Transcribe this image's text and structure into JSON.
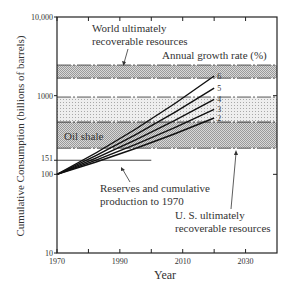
{
  "chart_data": {
    "type": "line",
    "title": "",
    "xlabel": "Year",
    "ylabel": "Cumulative Consumption (billions of barrels)",
    "yscale": "log",
    "xlim": [
      1970,
      2040
    ],
    "ylim": [
      10,
      10000
    ],
    "x_ticks": [
      1970,
      1990,
      2010,
      2030
    ],
    "x_minor_ticks": [
      1980,
      2000,
      2020
    ],
    "y_ticks": [
      {
        "value": 10,
        "label": "10"
      },
      {
        "value": 100,
        "label": "100"
      },
      {
        "value": 151,
        "label": "151"
      },
      {
        "value": 1000,
        "label": "1000"
      },
      {
        "value": 10000,
        "label": "10,000"
      }
    ],
    "legend_title": "Annual growth rate (%)",
    "series": [
      {
        "name": "2",
        "x": [
          1970,
          2020
        ],
        "y": [
          100,
          520
        ]
      },
      {
        "name": "3",
        "x": [
          1970,
          2020
        ],
        "y": [
          100,
          670
        ]
      },
      {
        "name": "4",
        "x": [
          1970,
          2020
        ],
        "y": [
          100,
          900
        ]
      },
      {
        "name": "5",
        "x": [
          1970,
          2020
        ],
        "y": [
          100,
          1250
        ]
      },
      {
        "name": "6",
        "x": [
          1970,
          2020
        ],
        "y": [
          100,
          1780
        ]
      }
    ],
    "bands": [
      {
        "name": "World ultimately recoverable resources",
        "y": [
          1670,
          2450
        ],
        "pattern": "dense"
      },
      {
        "name": "Oil shale (upper)",
        "y": [
          460,
          960
        ],
        "pattern": "dots"
      },
      {
        "name": "U. S. ultimately recoverable resources",
        "y": [
          215,
          460
        ],
        "pattern": "dense"
      }
    ],
    "reference_lines": [
      {
        "name": "Reserves and cumulative production to 1970",
        "y": 151,
        "x": [
          1970,
          2000
        ]
      }
    ],
    "annotations": [
      {
        "text": "World ultimately recoverable resources",
        "points_to": "world band"
      },
      {
        "text": "Oil shale",
        "points_to": "oil shale band"
      },
      {
        "text": "Reserves and cumulative production to 1970",
        "points_to": "151 line"
      },
      {
        "text": "U. S. ultimately recoverable resources",
        "points_to": "US band"
      }
    ]
  },
  "labels": {
    "world1": "World ultimately",
    "world2": "recoverable resources",
    "growth": "Annual growth rate (%)",
    "oil": "Oil shale",
    "res1": "Reserves and cumulative",
    "res2": "production to 1970",
    "us1": "U. S. ultimately",
    "us2": "recoverable resources",
    "xlabel": "Year",
    "ylabel": "Cumulative Consumption  (billions of barrels)"
  }
}
